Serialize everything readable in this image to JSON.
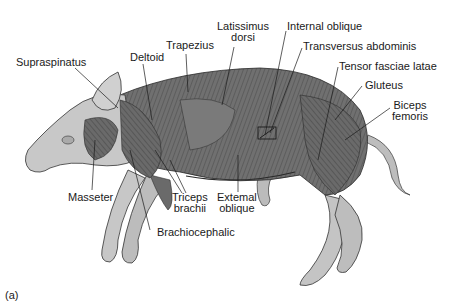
{
  "figure": {
    "panel_label": "(a)",
    "colors": {
      "muscle": "#6e6e6e",
      "skin": "#c9c9c9",
      "line": "#1a1a1a",
      "background": "#ffffff"
    },
    "labels": {
      "supraspinatus": "Supraspinatus",
      "deltoid": "Deltoid",
      "trapezius": "Trapezius",
      "latissimus_1": "Latissimus",
      "latissimus_2": "dorsi",
      "internal_oblique": "Internal oblique",
      "transversus": "Transversus abdominis",
      "tensor": "Tensor fasciae latae",
      "gluteus": "Gluteus",
      "biceps_1": "Biceps",
      "biceps_2": "femoris",
      "masseter": "Masseter",
      "triceps_1": "Triceps",
      "triceps_2": "brachii",
      "external_1": "Extemal",
      "external_2": "oblique",
      "brachiocephalic": "Brachiocephalic"
    }
  }
}
